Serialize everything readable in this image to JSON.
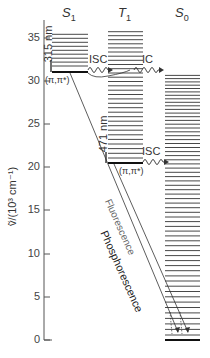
{
  "axis": {
    "label": "ṽ/(10³ cm⁻¹)",
    "ticks": [
      {
        "value": "35",
        "y": 38
      },
      {
        "value": "30",
        "y": 81
      },
      {
        "value": "25",
        "y": 124
      },
      {
        "value": "20",
        "y": 167
      },
      {
        "value": "15",
        "y": 210
      },
      {
        "value": "10",
        "y": 254
      },
      {
        "value": "5",
        "y": 297
      },
      {
        "value": "0",
        "y": 340
      }
    ]
  },
  "states": {
    "s1": {
      "name": "S",
      "sub": "1",
      "character": "(π,π*)",
      "wavelength": "315 nm"
    },
    "t1": {
      "name": "T",
      "sub": "1",
      "character": "(π,π*)",
      "wavelength": "471 nm"
    },
    "s0": {
      "name": "S",
      "sub": "0"
    }
  },
  "processes": {
    "isc1": "ISC",
    "ic": "IC",
    "isc2": "ISC",
    "phosphorescence": "Phosphorescence",
    "fluorescence": "Fluorescence"
  }
}
